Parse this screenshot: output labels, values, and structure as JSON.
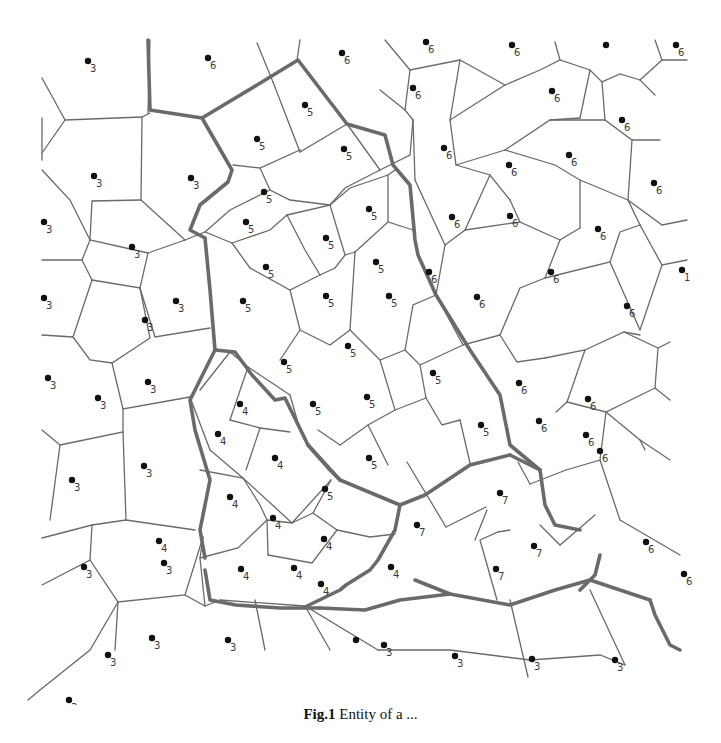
{
  "figure": {
    "caption_label": "Fig.1",
    "caption_text": "Entity of a ..."
  },
  "legend_note": "Numbers denote region labels assigned to each Voronoi site",
  "colors": {
    "edge": "#6a6a6a",
    "site": "#111111",
    "label": "#3a3a3a",
    "background": "#ffffff"
  },
  "sites": [
    {
      "x": 88,
      "y": 61,
      "label": "3"
    },
    {
      "x": 208,
      "y": 58,
      "label": "6"
    },
    {
      "x": 342,
      "y": 53,
      "label": "6"
    },
    {
      "x": 426,
      "y": 42,
      "label": "6"
    },
    {
      "x": 512,
      "y": 45,
      "label": "6"
    },
    {
      "x": 606,
      "y": 45,
      "label": ""
    },
    {
      "x": 676,
      "y": 45,
      "label": "6"
    },
    {
      "x": 305,
      "y": 105,
      "label": "5"
    },
    {
      "x": 413,
      "y": 88,
      "label": "6"
    },
    {
      "x": 552,
      "y": 91,
      "label": "6"
    },
    {
      "x": 622,
      "y": 120,
      "label": "6"
    },
    {
      "x": 257,
      "y": 139,
      "label": "5"
    },
    {
      "x": 344,
      "y": 149,
      "label": "5"
    },
    {
      "x": 444,
      "y": 148,
      "label": "6"
    },
    {
      "x": 509,
      "y": 165,
      "label": "6"
    },
    {
      "x": 569,
      "y": 155,
      "label": "6"
    },
    {
      "x": 94,
      "y": 176,
      "label": "3"
    },
    {
      "x": 191,
      "y": 178,
      "label": "3"
    },
    {
      "x": 264,
      "y": 192,
      "label": "5"
    },
    {
      "x": 654,
      "y": 183,
      "label": "6"
    },
    {
      "x": 44,
      "y": 222,
      "label": "3"
    },
    {
      "x": 132,
      "y": 247,
      "label": "3"
    },
    {
      "x": 246,
      "y": 222,
      "label": "5"
    },
    {
      "x": 326,
      "y": 238,
      "label": "5"
    },
    {
      "x": 369,
      "y": 209,
      "label": "5"
    },
    {
      "x": 452,
      "y": 217,
      "label": "6"
    },
    {
      "x": 510,
      "y": 216,
      "label": "6"
    },
    {
      "x": 598,
      "y": 229,
      "label": "6"
    },
    {
      "x": 266,
      "y": 267,
      "label": "5"
    },
    {
      "x": 376,
      "y": 262,
      "label": "5"
    },
    {
      "x": 429,
      "y": 272,
      "label": "6"
    },
    {
      "x": 551,
      "y": 272,
      "label": "6"
    },
    {
      "x": 682,
      "y": 270,
      "label": "1"
    },
    {
      "x": 44,
      "y": 298,
      "label": "3"
    },
    {
      "x": 176,
      "y": 301,
      "label": "3"
    },
    {
      "x": 243,
      "y": 301,
      "label": "5"
    },
    {
      "x": 326,
      "y": 296,
      "label": "5"
    },
    {
      "x": 389,
      "y": 296,
      "label": "5"
    },
    {
      "x": 477,
      "y": 297,
      "label": "6"
    },
    {
      "x": 627,
      "y": 306,
      "label": "6"
    },
    {
      "x": 145,
      "y": 320,
      "label": "3"
    },
    {
      "x": 284,
      "y": 362,
      "label": "5"
    },
    {
      "x": 348,
      "y": 346,
      "label": "5"
    },
    {
      "x": 433,
      "y": 373,
      "label": "5"
    },
    {
      "x": 519,
      "y": 383,
      "label": "6"
    },
    {
      "x": 588,
      "y": 399,
      "label": "6"
    },
    {
      "x": 48,
      "y": 378,
      "label": "3"
    },
    {
      "x": 148,
      "y": 382,
      "label": "3"
    },
    {
      "x": 98,
      "y": 398,
      "label": "3"
    },
    {
      "x": 240,
      "y": 404,
      "label": "4"
    },
    {
      "x": 313,
      "y": 404,
      "label": "5"
    },
    {
      "x": 367,
      "y": 397,
      "label": "5"
    },
    {
      "x": 481,
      "y": 425,
      "label": "5"
    },
    {
      "x": 586,
      "y": 435,
      "label": "6"
    },
    {
      "x": 218,
      "y": 434,
      "label": "4"
    },
    {
      "x": 275,
      "y": 458,
      "label": "4"
    },
    {
      "x": 369,
      "y": 458,
      "label": "5"
    },
    {
      "x": 539,
      "y": 421,
      "label": "6"
    },
    {
      "x": 600,
      "y": 451,
      "label": "6"
    },
    {
      "x": 144,
      "y": 466,
      "label": "3"
    },
    {
      "x": 72,
      "y": 480,
      "label": "3"
    },
    {
      "x": 230,
      "y": 497,
      "label": "4"
    },
    {
      "x": 325,
      "y": 489,
      "label": "5"
    },
    {
      "x": 500,
      "y": 493,
      "label": "7"
    },
    {
      "x": 273,
      "y": 518,
      "label": "4"
    },
    {
      "x": 417,
      "y": 525,
      "label": "7"
    },
    {
      "x": 646,
      "y": 542,
      "label": "6"
    },
    {
      "x": 159,
      "y": 541,
      "label": "4"
    },
    {
      "x": 324,
      "y": 539,
      "label": "4"
    },
    {
      "x": 534,
      "y": 546,
      "label": "7"
    },
    {
      "x": 84,
      "y": 567,
      "label": "3"
    },
    {
      "x": 164,
      "y": 563,
      "label": "3"
    },
    {
      "x": 241,
      "y": 569,
      "label": "4"
    },
    {
      "x": 294,
      "y": 568,
      "label": "4"
    },
    {
      "x": 391,
      "y": 567,
      "label": "4"
    },
    {
      "x": 496,
      "y": 569,
      "label": "7"
    },
    {
      "x": 684,
      "y": 574,
      "label": "6"
    },
    {
      "x": 321,
      "y": 584,
      "label": "4"
    },
    {
      "x": 228,
      "y": 640,
      "label": "3"
    },
    {
      "x": 152,
      "y": 638,
      "label": "3"
    },
    {
      "x": 384,
      "y": 645,
      "label": "3"
    },
    {
      "x": 455,
      "y": 656,
      "label": "3"
    },
    {
      "x": 532,
      "y": 659,
      "label": "3"
    },
    {
      "x": 615,
      "y": 660,
      "label": "3"
    },
    {
      "x": 108,
      "y": 655,
      "label": "3"
    },
    {
      "x": 69,
      "y": 700,
      "label": "3"
    },
    {
      "x": 356,
      "y": 640,
      "label": ""
    }
  ],
  "chart_data": {
    "type": "diagram",
    "labels_present": [
      "3",
      "4",
      "5",
      "6",
      "7"
    ]
  }
}
